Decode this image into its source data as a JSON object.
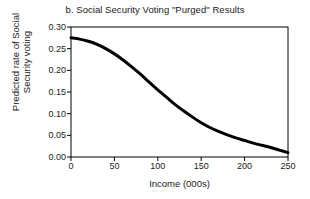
{
  "chart_data": {
    "type": "line",
    "title": "b. Social Security Voting \"Purged\" Results",
    "xlabel": "Income (000s)",
    "ylabel": "Predicted rate of Social\nSecurity voting",
    "xlim": [
      0,
      250
    ],
    "ylim": [
      0,
      0.3
    ],
    "grid": false,
    "legend": null,
    "xticks": [
      0,
      50,
      100,
      150,
      200,
      250
    ],
    "xtick_labels": [
      "0",
      "50",
      "100",
      "150",
      "200",
      "250"
    ],
    "yticks": [
      0.0,
      0.05,
      0.1,
      0.15,
      0.2,
      0.25,
      0.3
    ],
    "ytick_labels": [
      "0.00",
      "0.05",
      "0.10",
      "0.15",
      "0.20",
      "0.25",
      "0.30"
    ],
    "line_color": "#000000",
    "line_width": 3,
    "frame_color": "#000000",
    "background_color": "#ffffff",
    "series": [
      {
        "name": "Predicted rate of Social Security voting",
        "x": [
          0,
          10,
          20,
          30,
          40,
          50,
          60,
          70,
          80,
          90,
          100,
          110,
          120,
          130,
          140,
          150,
          160,
          170,
          180,
          190,
          200,
          210,
          220,
          230,
          240,
          250
        ],
        "values": [
          0.275,
          0.272,
          0.267,
          0.26,
          0.25,
          0.238,
          0.224,
          0.208,
          0.191,
          0.173,
          0.155,
          0.138,
          0.121,
          0.106,
          0.092,
          0.079,
          0.068,
          0.059,
          0.051,
          0.044,
          0.038,
          0.032,
          0.027,
          0.022,
          0.016,
          0.01
        ]
      }
    ]
  }
}
